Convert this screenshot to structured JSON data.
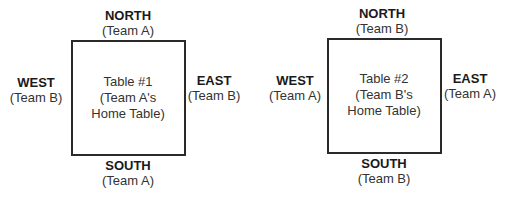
{
  "tables": [
    {
      "title": "Table #1",
      "subtitle_1": "(Team A's",
      "subtitle_2": "Home Table)",
      "north": {
        "dir": "NORTH",
        "team": "(Team A)"
      },
      "south": {
        "dir": "SOUTH",
        "team": "(Team A)"
      },
      "west": {
        "dir": "WEST",
        "team": "(Team B)"
      },
      "east": {
        "dir": "EAST",
        "team": "(Team B)"
      }
    },
    {
      "title": "Table #2",
      "subtitle_1": "(Team B's",
      "subtitle_2": "Home Table)",
      "north": {
        "dir": "NORTH",
        "team": "(Team B)"
      },
      "south": {
        "dir": "SOUTH",
        "team": "(Team B)"
      },
      "west": {
        "dir": "WEST",
        "team": "(Team A)"
      },
      "east": {
        "dir": "EAST",
        "team": "(Team A)"
      }
    }
  ]
}
